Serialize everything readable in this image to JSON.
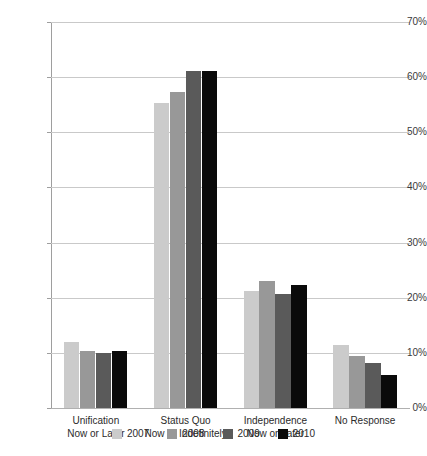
{
  "chart_data": {
    "type": "bar",
    "title": "",
    "subtitle": "",
    "xlabel": "",
    "ylabel": "",
    "ylim": [
      0,
      70
    ],
    "y_unit": "%",
    "grid": true,
    "legend_position": "bottom",
    "categories": [
      "Unification\nNow or Later",
      "Status Quo\nNow or Indefinitely",
      "Independence\nNow or Later",
      "No Response"
    ],
    "category_lines": [
      {
        "line1": "Unification",
        "line2": "Now or Later"
      },
      {
        "line1": "Status Quo",
        "line2": "Now or Indefinitely"
      },
      {
        "line1": "Independence",
        "line2": "Now or Later"
      },
      {
        "line1": "No Response",
        "line2": ""
      }
    ],
    "y_ticks": [
      {
        "value": 0,
        "label": "0%"
      },
      {
        "value": 10,
        "label": "10%"
      },
      {
        "value": 20,
        "label": "20%"
      },
      {
        "value": 30,
        "label": "30%"
      },
      {
        "value": 40,
        "label": "40%"
      },
      {
        "value": 50,
        "label": "50%"
      },
      {
        "value": 60,
        "label": "60%"
      },
      {
        "value": 70,
        "label": "70%"
      }
    ],
    "series": [
      {
        "name": "2007",
        "color": "#cbcbcb",
        "values": [
          12.0,
          55.3,
          21.3,
          11.5
        ]
      },
      {
        "name": "2008",
        "color": "#989898",
        "values": [
          10.3,
          57.3,
          23.0,
          9.5
        ]
      },
      {
        "name": "2009",
        "color": "#5a5a5a",
        "values": [
          10.0,
          61.2,
          20.7,
          8.1
        ]
      },
      {
        "name": "2010",
        "color": "#0a0a0a",
        "values": [
          10.3,
          61.2,
          22.3,
          6.0
        ]
      }
    ]
  },
  "colors": {
    "gridline": "#c9c9c9",
    "axis": "#9e9e9e",
    "text": "#2b2b2b",
    "background": "#ffffff"
  }
}
